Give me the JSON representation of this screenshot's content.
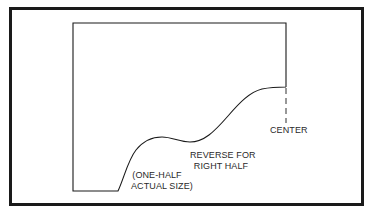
{
  "diagram": {
    "type": "pattern-template",
    "labels": {
      "center": "CENTER",
      "reverse_line1": "REVERSE FOR",
      "reverse_line2": "RIGHT HALF",
      "scale_line1": "(ONE-HALF",
      "scale_line2": "ACTUAL SIZE)"
    },
    "colors": {
      "line": "#1a1a1a",
      "background": "#ffffff"
    }
  }
}
